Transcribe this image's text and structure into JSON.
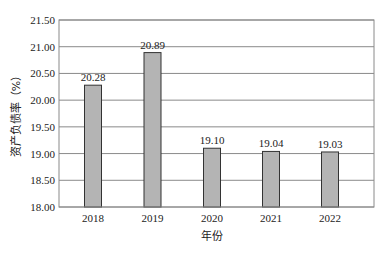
{
  "chart_data": {
    "type": "bar",
    "title": "",
    "categories": [
      "2018",
      "2019",
      "2020",
      "2021",
      "2022"
    ],
    "values": [
      20.28,
      20.89,
      19.1,
      19.04,
      19.03
    ],
    "data_labels": [
      "20.28",
      "20.89",
      "19.10",
      "19.04",
      "19.03"
    ],
    "xlabel": "年份",
    "ylabel": "资产负债率（%）",
    "ylim": [
      18.0,
      21.5
    ],
    "yticks": [
      "18.00",
      "18.50",
      "19.00",
      "19.50",
      "20.00",
      "20.50",
      "21.00",
      "21.50"
    ],
    "grid": true,
    "legend": null,
    "colors": {
      "bar_fill": "#b4b4b4",
      "bar_stroke": "#333333",
      "grid": "#8a8a8a",
      "frame": "#8a8a8a"
    }
  }
}
